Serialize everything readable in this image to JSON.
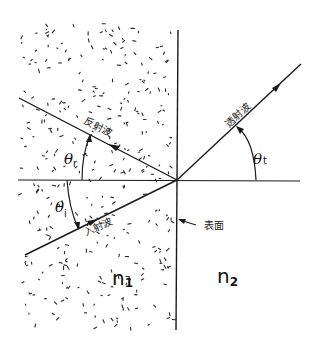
{
  "diagram": {
    "labels": {
      "reflected_wave": "反射波",
      "incident_wave": "入射波",
      "transmitted_wave": "透射波",
      "surface": "表面",
      "theta_r": "θ",
      "theta_r_sub": "r",
      "theta_i": "θ",
      "theta_i_sub": "i",
      "theta_t": "θ",
      "theta_t_sub": "t",
      "medium1": "n",
      "medium1_sub": "1",
      "medium2": "n",
      "medium2_sub": "2"
    },
    "colors": {
      "ink": "#1a1a1a",
      "background": "#ffffff"
    }
  }
}
